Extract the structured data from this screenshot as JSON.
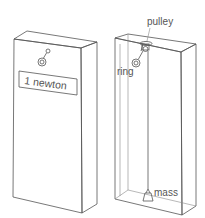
{
  "diagram": {
    "left_box": {
      "label_text": "1 newton"
    },
    "right_box": {
      "labels": {
        "pulley": "pulley",
        "ring": "ring",
        "mass": "mass"
      }
    },
    "colors": {
      "line": "#555555",
      "background": "#ffffff"
    }
  }
}
